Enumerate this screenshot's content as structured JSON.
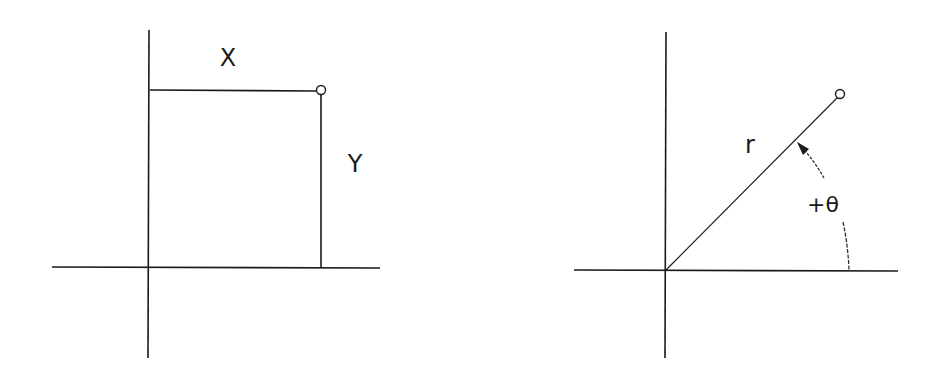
{
  "diagram": {
    "colors": {
      "background": "#ffffff",
      "ink": "#1a1a1a"
    },
    "panels": [
      {
        "id": "cartesian",
        "description": "Point located by rectangular coordinates X and Y",
        "labels": {
          "x": "X",
          "y": "Y"
        }
      },
      {
        "id": "polar",
        "description": "Point located by polar coordinates r and angle +theta",
        "labels": {
          "radius": "r",
          "angle": "+θ"
        }
      }
    ]
  }
}
